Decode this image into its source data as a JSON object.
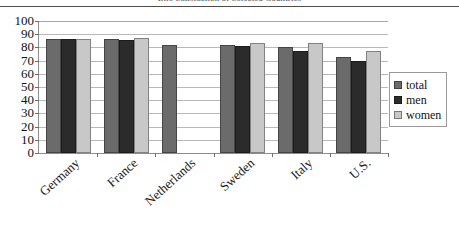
{
  "chart_data": {
    "type": "bar",
    "title": "Life Satisfaction of Selected Countries",
    "xlabel": "",
    "ylabel": "",
    "ylim": [
      0,
      100
    ],
    "ytick_step": 10,
    "yticks": [
      "100",
      "90",
      "80",
      "70",
      "60",
      "50",
      "40",
      "30",
      "20",
      "10",
      "0"
    ],
    "grid": true,
    "legend_position": "right",
    "categories": [
      "Germany",
      "France",
      "Netherlands",
      "Sweden",
      "Italy",
      "U.S."
    ],
    "series": [
      {
        "name": "total",
        "color": "#6b6b6b",
        "values": [
          86,
          86,
          82,
          82,
          80.5,
          73
        ]
      },
      {
        "name": "men",
        "color": "#2b2b2b",
        "values": [
          86,
          85.5,
          null,
          81,
          77,
          70
        ]
      },
      {
        "name": "women",
        "color": "#c8c8c8",
        "values": [
          86,
          87,
          null,
          83,
          83,
          77
        ]
      }
    ]
  },
  "legend": {
    "items": [
      {
        "label": "total",
        "color": "#6b6b6b"
      },
      {
        "label": "men",
        "color": "#2b2b2b"
      },
      {
        "label": "women",
        "color": "#c8c8c8"
      }
    ]
  }
}
